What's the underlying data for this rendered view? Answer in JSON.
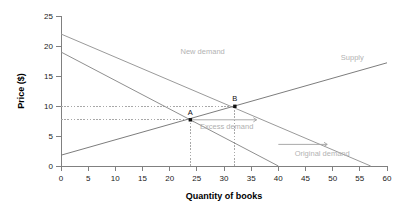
{
  "chart_data": {
    "type": "line",
    "title": "",
    "xlabel": "Quantity of books",
    "ylabel": "Price ($)",
    "xlim": [
      0,
      60
    ],
    "ylim": [
      0,
      25
    ],
    "xticks": [
      0,
      5,
      10,
      15,
      20,
      25,
      30,
      35,
      40,
      45,
      50,
      55,
      60
    ],
    "yticks": [
      0,
      5,
      10,
      15,
      20,
      25
    ],
    "grid": false,
    "legend_position": "inline-labels",
    "series": [
      {
        "name": "Supply",
        "label": "Supply",
        "color": "#7d7d7d",
        "points": [
          [
            0,
            1.8
          ],
          [
            60,
            17.2
          ]
        ]
      },
      {
        "name": "Original demand",
        "label": "Original demand",
        "color": "#8f8f8f",
        "points": [
          [
            0,
            19.0
          ],
          [
            40,
            0.0
          ]
        ]
      },
      {
        "name": "New demand",
        "label": "New demand",
        "color": "#9a9a9a",
        "points": [
          [
            0,
            22.0
          ],
          [
            57,
            0.0
          ]
        ]
      }
    ],
    "points": [
      {
        "name": "A",
        "label": "A",
        "x": 23.8,
        "y": 7.7
      },
      {
        "name": "B",
        "label": "B",
        "x": 32.0,
        "y": 9.95
      }
    ],
    "guides": [
      {
        "type": "h",
        "y": 9.95,
        "from_x": 0,
        "to_x": 32.0
      },
      {
        "type": "h",
        "y": 7.7,
        "from_x": 0,
        "to_x": 23.8
      },
      {
        "type": "v",
        "x": 23.8,
        "from_y": 0,
        "to_y": 7.7
      },
      {
        "type": "v",
        "x": 32.0,
        "from_y": 0,
        "to_y": 9.95
      }
    ],
    "annotations": [
      {
        "name": "excess-demand",
        "label": "Excess demand",
        "x": 30.5,
        "y": 6.2
      },
      {
        "name": "excess-demand-arrow",
        "label": "",
        "from_x": 23.8,
        "to_x": 36.0,
        "y": 7.7,
        "double": true
      },
      {
        "name": "shift-arrow",
        "label": "",
        "from_x": 40.0,
        "to_x": 49.0,
        "y": 3.6,
        "double": false
      }
    ],
    "series_label_positions": [
      {
        "name": "Supply",
        "x": 51.5,
        "y": 17.6
      },
      {
        "name": "New demand",
        "x": 22.0,
        "y": 18.6
      },
      {
        "name": "Original demand",
        "x": 43.0,
        "y": 1.6
      }
    ]
  },
  "colors": {
    "axis": "#808080",
    "tick_text": "#1a1a1a",
    "series_label": "#b3b3b3",
    "annotation": "#b0b0b0",
    "marker": "#111111",
    "guide": "#a8a8a8",
    "background": "#ffffff"
  }
}
